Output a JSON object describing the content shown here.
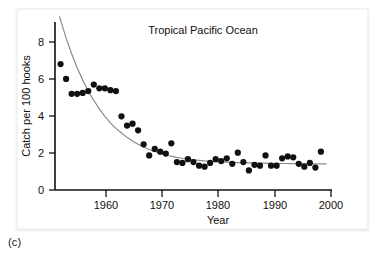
{
  "figure": {
    "caption": "(c)",
    "panel_background": "#ffffff",
    "card_background": "#f2f2f2"
  },
  "chart_data": {
    "type": "scatter",
    "title": "Tropical Pacific Ocean",
    "xlabel": "Year",
    "ylabel": "Catch per 100  hooks",
    "xlim": [
      1951,
      2001
    ],
    "ylim": [
      0,
      9
    ],
    "xticks": [
      1960,
      1970,
      1980,
      1990,
      2000
    ],
    "xtick_labels": [
      "1960",
      "1970",
      "1980",
      "1990",
      "2000"
    ],
    "yticks": [
      0,
      2,
      4,
      6,
      8
    ],
    "ytick_labels": [
      "0",
      "2",
      "4",
      "6",
      "8"
    ],
    "grid": false,
    "legend": null,
    "marker_color": "#111111",
    "marker_size": 5.0,
    "fit_curve_color": "#8a8a8a",
    "x": [
      1952,
      1953,
      1954,
      1955,
      1956,
      1957,
      1958,
      1959,
      1960,
      1961,
      1962,
      1963,
      1964,
      1965,
      1966,
      1967,
      1968,
      1969,
      1970,
      1971,
      1972,
      1973,
      1974,
      1975,
      1976,
      1977,
      1978,
      1979,
      1980,
      1981,
      1982,
      1983,
      1984,
      1985,
      1986,
      1987,
      1988,
      1989,
      1990,
      1991,
      1992,
      1993,
      1994,
      1995,
      1996,
      1997,
      1998,
      1999
    ],
    "values": [
      6.75,
      5.95,
      5.15,
      5.15,
      5.2,
      5.3,
      5.65,
      5.45,
      5.45,
      5.35,
      5.3,
      3.95,
      3.45,
      3.55,
      3.2,
      2.45,
      1.85,
      2.2,
      2.05,
      1.95,
      2.5,
      1.5,
      1.45,
      1.65,
      1.5,
      1.3,
      1.25,
      1.45,
      1.65,
      1.55,
      1.7,
      1.4,
      2.0,
      1.5,
      1.05,
      1.35,
      1.3,
      1.85,
      1.3,
      1.3,
      1.7,
      1.8,
      1.75,
      1.4,
      1.25,
      1.45,
      1.2,
      2.05
    ],
    "fit_curve": {
      "form": "exponential-decay",
      "description": "fitted declining curve from about 9.3 in 1952 leveling near 1.4 by 2000",
      "points_x": [
        1951.8,
        1953,
        1954,
        1955,
        1956,
        1957,
        1958,
        1959,
        1960,
        1961,
        1962,
        1963,
        1964,
        1965,
        1966,
        1967,
        1968,
        1969,
        1970,
        1971,
        1972,
        1973,
        1974,
        1975,
        1976,
        1977,
        1978,
        1979,
        1980,
        1982,
        1984,
        1986,
        1988,
        1990,
        1992,
        1994,
        1996,
        1998,
        2000
      ],
      "points_y": [
        9.3,
        8.15,
        7.3,
        6.55,
        5.9,
        5.3,
        4.8,
        4.35,
        3.95,
        3.6,
        3.3,
        3.05,
        2.82,
        2.62,
        2.45,
        2.3,
        2.17,
        2.06,
        1.96,
        1.88,
        1.81,
        1.75,
        1.7,
        1.66,
        1.62,
        1.59,
        1.56,
        1.54,
        1.52,
        1.49,
        1.47,
        1.45,
        1.44,
        1.43,
        1.42,
        1.41,
        1.41,
        1.4,
        1.4
      ]
    }
  }
}
